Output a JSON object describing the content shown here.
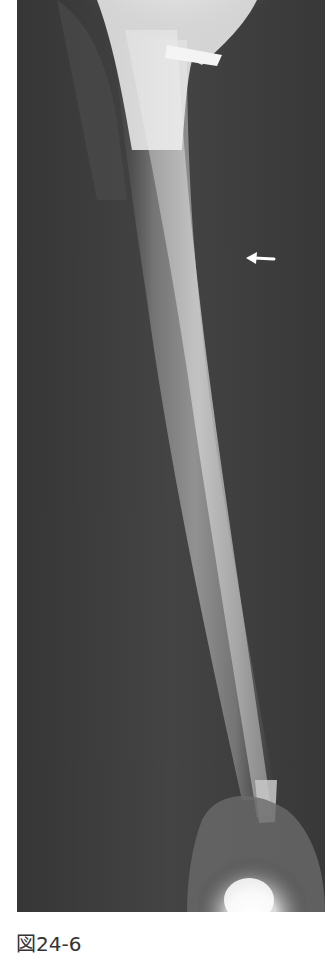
{
  "figure": {
    "type": "x-ray radiograph",
    "annotation": {
      "arrow_icon": "left-arrow-icon",
      "direction": "left"
    },
    "colors": {
      "background": "#3a3a3a",
      "bone": "#8a8a8a",
      "implant": "#e8e8e8",
      "arrow": "#ffffff"
    }
  },
  "caption": {
    "label": "図24-6"
  }
}
